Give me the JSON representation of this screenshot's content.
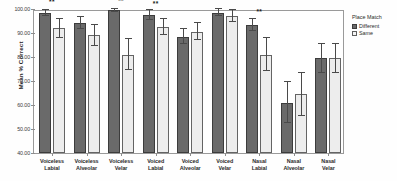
{
  "chart_data": {
    "type": "bar",
    "title": "",
    "xlabel": "",
    "ylabel": "Mean % Correct",
    "ylim": [
      40,
      100
    ],
    "ytick_labels": [
      "100.00",
      "90.00",
      "80.00",
      "70.00",
      "60.00",
      "50.00",
      "40.00"
    ],
    "ytick_values": [
      100,
      90,
      80,
      70,
      60,
      50,
      40
    ],
    "grid": false,
    "legend_position": "right",
    "legend_title": "Place Match",
    "categories": [
      "Voiceless Labial",
      "Voiceless Alveolar",
      "Voiceless Velar",
      "Voiced Labial",
      "Voiced Alveolar",
      "Voiced Velar",
      "Nasal Labial",
      "Nasal Alveolar",
      "Nasal Velar"
    ],
    "category_lines": [
      [
        "Voiceless",
        "Labial"
      ],
      [
        "Voiceless",
        "Alveolar"
      ],
      [
        "Voiceless",
        "Velar"
      ],
      [
        "Voiced",
        "Labial"
      ],
      [
        "Voiced",
        "Alveolar"
      ],
      [
        "Voiced",
        "Velar"
      ],
      [
        "Nasal",
        "Labial"
      ],
      [
        "Nasal",
        "Alveolar"
      ],
      [
        "Nasal",
        "Velar"
      ]
    ],
    "series": [
      {
        "name": "Different",
        "color": "#6a6a6a",
        "values": [
          98.5,
          94.0,
          99.5,
          97.5,
          88.5,
          98.5,
          93.5,
          61.0,
          79.5
        ],
        "err_low": [
          1.5,
          2.5,
          0.8,
          2.0,
          3.0,
          1.5,
          2.5,
          8.5,
          6.0
        ],
        "err_high": [
          1.2,
          2.5,
          0.5,
          2.0,
          3.0,
          1.5,
          2.5,
          8.5,
          6.0
        ]
      },
      {
        "name": "Same",
        "color": "#ededed",
        "values": [
          92.0,
          89.0,
          81.0,
          92.5,
          90.5,
          97.0,
          81.0,
          64.5,
          79.5
        ],
        "err_low": [
          4.0,
          4.5,
          6.5,
          3.5,
          3.5,
          2.5,
          7.0,
          9.0,
          6.0
        ],
        "err_high": [
          4.0,
          4.5,
          6.5,
          3.5,
          3.5,
          2.5,
          7.0,
          9.0,
          6.0
        ]
      }
    ],
    "annotations": [
      {
        "category_index": 0,
        "text": "**",
        "y": 101.5
      },
      {
        "category_index": 2,
        "text": "**",
        "y": 102.0
      },
      {
        "category_index": 3,
        "text": "**",
        "y": 101.0
      },
      {
        "category_index": 6,
        "text": "**",
        "y": 97.5
      }
    ]
  },
  "legend": {
    "title": "Place Match",
    "items": [
      {
        "label": "Different",
        "swatch": "different"
      },
      {
        "label": "Same",
        "swatch": "same"
      }
    ]
  },
  "axes": {
    "y_title": "Mean % Correct"
  }
}
